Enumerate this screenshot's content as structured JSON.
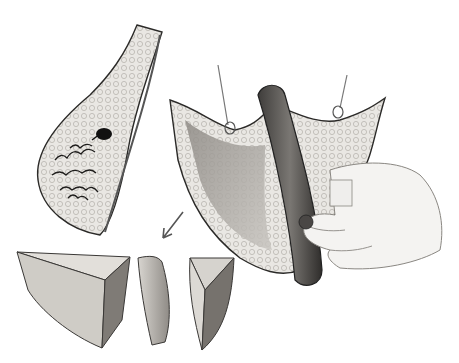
{
  "figure": {
    "style": "grayscale medical illustration",
    "panels": [
      {
        "id": "organ-sagittal-view",
        "description": "sagittal view of organ with dark lesion and lobular ducts"
      },
      {
        "id": "wedge-excision-view",
        "description": "excised wedge held by gloved hand with retractor hooks"
      },
      {
        "id": "specimen-segments",
        "description": "specimen cut into three wedge segments"
      }
    ],
    "arrow": {
      "direction": "down-left",
      "meaning": "sequence to sectioned specimen"
    },
    "colors": {
      "background": "#ffffff",
      "tissue_light": "#e8e6e2",
      "tissue_mid": "#b9b6b0",
      "tissue_dark": "#3a3836",
      "retractor": "#5a5754",
      "lesion": "#111111",
      "skin": "#f4f3f1"
    }
  }
}
